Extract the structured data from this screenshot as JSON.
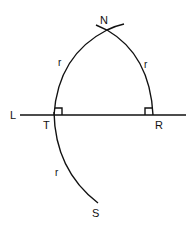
{
  "diagram": {
    "labels": {
      "N": "N",
      "L": "L",
      "T": "T",
      "R": "R",
      "S": "S",
      "r_left_upper": "r",
      "r_right_upper": "r",
      "r_lower": "r"
    },
    "colors": {
      "ink": "#111111",
      "background": "#ffffff"
    }
  }
}
